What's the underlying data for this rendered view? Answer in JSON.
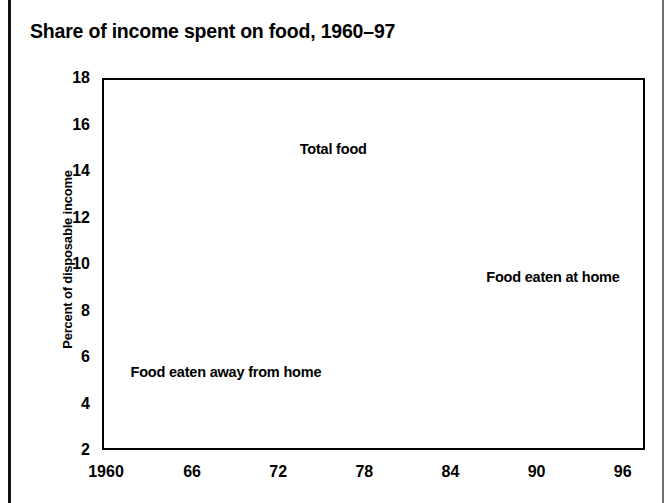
{
  "title": "Share of income spent on food, 1960–97",
  "axes": {
    "y_title": "Percent of disposable income",
    "y_ticks": [
      "18",
      "16",
      "14",
      "12",
      "10",
      "8",
      "6",
      "4",
      "2"
    ],
    "x_ticks": [
      "1960",
      "66",
      "72",
      "78",
      "84",
      "90",
      "96"
    ]
  },
  "labels": {
    "total_food": "Total food",
    "food_at_home": "Food eaten at home",
    "food_away": "Food eaten away from home"
  },
  "colors": {
    "line_total": "#6e6e6e",
    "line_dashed": "#111111",
    "frame": "#000000",
    "background": "#ffffff"
  },
  "chart_data": {
    "type": "line",
    "title": "Share of income spent on food, 1960–97",
    "xlabel": "",
    "ylabel": "Percent of disposable income",
    "xlim": [
      1960,
      1997
    ],
    "ylim": [
      2,
      18
    ],
    "ytick_step": 2,
    "grid": false,
    "legend": "inline-annotations",
    "x": [
      1960,
      1961,
      1962,
      1963,
      1964,
      1965,
      1966,
      1967,
      1968,
      1969,
      1970,
      1971,
      1972,
      1973,
      1974,
      1975,
      1976,
      1977,
      1978,
      1979,
      1980,
      1981,
      1982,
      1983,
      1984,
      1985,
      1986,
      1987,
      1988,
      1989,
      1990,
      1991,
      1992,
      1993,
      1994,
      1995,
      1996,
      1997
    ],
    "series": [
      {
        "name": "Total food",
        "style": "solid",
        "color": "#6e6e6e",
        "values": [
          17.4,
          17.0,
          16.6,
          16.2,
          15.8,
          15.4,
          15.0,
          14.5,
          14.1,
          13.9,
          13.8,
          13.8,
          13.5,
          13.6,
          13.9,
          13.8,
          13.6,
          13.4,
          13.3,
          13.3,
          13.2,
          13.0,
          12.9,
          12.7,
          12.3,
          12.2,
          12.1,
          12.0,
          11.9,
          11.8,
          11.9,
          11.9,
          11.7,
          11.4,
          11.5,
          11.4,
          11.1,
          10.7
        ]
      },
      {
        "name": "Food eaten at home",
        "style": "dashed-long",
        "color": "#111111",
        "values": [
          14.0,
          13.5,
          13.0,
          12.5,
          12.0,
          11.5,
          11.1,
          10.7,
          10.4,
          10.3,
          10.1,
          10.1,
          9.8,
          9.9,
          10.1,
          9.9,
          9.7,
          9.5,
          9.4,
          9.3,
          9.2,
          9.0,
          8.7,
          8.4,
          8.0,
          7.8,
          7.6,
          7.5,
          7.4,
          7.3,
          7.3,
          7.4,
          7.2,
          7.0,
          6.9,
          6.9,
          6.8,
          6.6
        ]
      },
      {
        "name": "Food eaten away from home",
        "style": "dashed-short",
        "color": "#111111",
        "values": [
          3.5,
          3.5,
          3.5,
          3.6,
          3.6,
          3.6,
          3.6,
          3.6,
          3.6,
          3.6,
          3.6,
          3.7,
          3.7,
          3.7,
          3.8,
          4.0,
          4.1,
          4.2,
          4.2,
          4.2,
          4.3,
          4.3,
          4.4,
          4.5,
          4.4,
          4.4,
          4.4,
          4.4,
          4.4,
          4.3,
          4.4,
          4.4,
          4.3,
          4.3,
          4.3,
          4.3,
          4.2,
          4.2
        ]
      }
    ],
    "annotations": [
      {
        "text": "Total food",
        "x": 1973.5,
        "y": 14.9
      },
      {
        "text": "Food eaten at home",
        "x": 1986.5,
        "y": 9.4
      },
      {
        "text": "Food eaten away from home",
        "x": 1975.0,
        "y": 5.3
      }
    ]
  }
}
